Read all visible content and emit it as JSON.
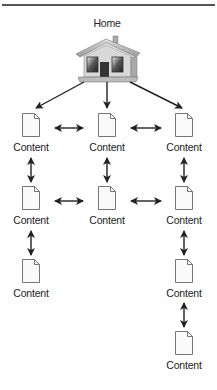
{
  "diagram": {
    "root": {
      "label": "Home",
      "icon": "house-icon"
    },
    "node_label": "Content",
    "node_icon": "document-icon",
    "nodes": [
      {
        "id": "c1r1",
        "label": "Content",
        "col": 1,
        "row": 1
      },
      {
        "id": "c2r1",
        "label": "Content",
        "col": 2,
        "row": 1
      },
      {
        "id": "c3r1",
        "label": "Content",
        "col": 3,
        "row": 1
      },
      {
        "id": "c1r2",
        "label": "Content",
        "col": 1,
        "row": 2
      },
      {
        "id": "c2r2",
        "label": "Content",
        "col": 2,
        "row": 2
      },
      {
        "id": "c3r2",
        "label": "Content",
        "col": 3,
        "row": 2
      },
      {
        "id": "c1r3",
        "label": "Content",
        "col": 1,
        "row": 3
      },
      {
        "id": "c3r3",
        "label": "Content",
        "col": 3,
        "row": 3
      },
      {
        "id": "c3r4",
        "label": "Content",
        "col": 3,
        "row": 4
      }
    ],
    "edges": [
      {
        "from": "Home",
        "to": "c1r1",
        "type": "one-way"
      },
      {
        "from": "Home",
        "to": "c2r1",
        "type": "one-way"
      },
      {
        "from": "Home",
        "to": "c3r1",
        "type": "one-way"
      },
      {
        "from": "c1r1",
        "to": "c2r1",
        "type": "two-way"
      },
      {
        "from": "c2r1",
        "to": "c3r1",
        "type": "two-way"
      },
      {
        "from": "c1r1",
        "to": "c1r2",
        "type": "two-way"
      },
      {
        "from": "c2r1",
        "to": "c2r2",
        "type": "two-way"
      },
      {
        "from": "c3r1",
        "to": "c3r2",
        "type": "two-way"
      },
      {
        "from": "c1r2",
        "to": "c2r2",
        "type": "two-way"
      },
      {
        "from": "c2r2",
        "to": "c3r2",
        "type": "two-way"
      },
      {
        "from": "c1r2",
        "to": "c1r3",
        "type": "two-way"
      },
      {
        "from": "c3r2",
        "to": "c3r3",
        "type": "two-way"
      },
      {
        "from": "c3r3",
        "to": "c3r4",
        "type": "two-way"
      }
    ]
  }
}
